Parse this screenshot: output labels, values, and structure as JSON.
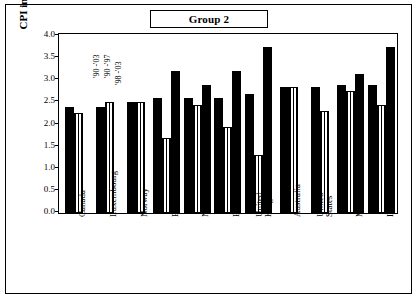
{
  "chart": {
    "title": "Group 2",
    "ylabel": "CPI in percent",
    "y_ticks": [
      "4.0",
      "3.5",
      "3.0",
      "2.5",
      "2.0",
      "1.5",
      "1.0",
      "0.5",
      "0.0"
    ],
    "annotations": [
      {
        "text": "'90 -'03"
      },
      {
        "text": "'90 -'97"
      },
      {
        "text": "'98 -'03"
      }
    ]
  },
  "chart_data": {
    "type": "bar",
    "title": "Group 2",
    "xlabel": "",
    "ylabel": "CPI in percent",
    "ylim": [
      0,
      4.0
    ],
    "grid": false,
    "legend": [
      "'90 -'03",
      "'90 -'97",
      "'98 -'03"
    ],
    "categories": [
      "Canada",
      "Luxembourg",
      "Norway",
      "ECCB",
      "Netherlands",
      "Bahamas",
      "United Kingdom",
      "Australia",
      "United States",
      "Malta",
      "Ireland"
    ],
    "series": [
      {
        "name": "'90 -'03",
        "values": [
          2.4,
          2.4,
          2.5,
          2.6,
          2.6,
          2.6,
          2.7,
          2.85,
          2.85,
          2.9,
          2.9
        ]
      },
      {
        "name": "'98 -'03",
        "values": [
          2.25,
          2.5,
          2.5,
          3.2,
          2.9,
          3.2,
          3.75,
          2.85,
          2.3,
          2.75,
          3.75
        ]
      }
    ],
    "bars": [
      {
        "category": "Canada",
        "values": [
          2.4,
          2.25
        ]
      },
      {
        "category": "Luxembourg",
        "values": [
          2.4,
          2.5
        ]
      },
      {
        "category": "Norway",
        "values": [
          2.5,
          2.5
        ]
      },
      {
        "category": "ECCB",
        "values": [
          2.6,
          1.7,
          3.2
        ]
      },
      {
        "category": "Netherlands",
        "values": [
          2.6,
          2.45,
          2.9
        ]
      },
      {
        "category": "Bahamas",
        "values": [
          2.6,
          1.95,
          3.2
        ]
      },
      {
        "category": "United Kingdom",
        "values": [
          2.7,
          1.3,
          3.75
        ]
      },
      {
        "category": "Australia",
        "values": [
          2.85,
          2.85
        ]
      },
      {
        "category": "United States",
        "values": [
          2.85,
          2.3
        ]
      },
      {
        "category": "Malta",
        "values": [
          2.9,
          2.75,
          3.15
        ]
      },
      {
        "category": "Ireland",
        "values": [
          2.9,
          2.45,
          3.75
        ]
      }
    ]
  }
}
